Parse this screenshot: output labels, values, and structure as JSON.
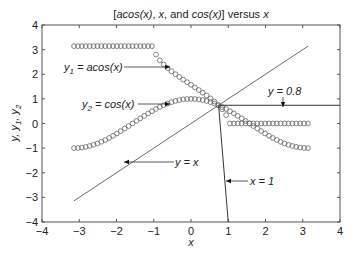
{
  "chart_data": {
    "type": "line",
    "title": "[acos(x), x, and cos(x)] versus x",
    "title_parts": [
      "[",
      "acos(x)",
      ", ",
      "x",
      ", and ",
      "cos(x)",
      "] versus ",
      "x"
    ],
    "xlabel": "x",
    "ylabel": "y, y1, y2",
    "xlim": [
      -4,
      4
    ],
    "ylim": [
      -4,
      4
    ],
    "xticks": [
      -4,
      -3,
      -2,
      -1,
      0,
      1,
      2,
      3,
      4
    ],
    "yticks": [
      -4,
      -3,
      -2,
      -1,
      0,
      1,
      2,
      3,
      4
    ],
    "grid": false,
    "series": [
      {
        "name": "y1 = acos(x)",
        "marker": "circle",
        "x_range": [
          -3.14,
          3.14
        ],
        "note": "real part of acos; flat at pi for x<-1, 0 for x>1"
      },
      {
        "name": "y2 = cos(x)",
        "marker": "circle",
        "x_range": [
          -3.14,
          3.14
        ]
      },
      {
        "name": "y = x",
        "marker": "none",
        "x_range": [
          -3.14,
          3.14
        ]
      },
      {
        "name": "y = 0.8",
        "marker": "none",
        "x_range": [
          0.74,
          4
        ]
      },
      {
        "name": "x = 1",
        "marker": "none",
        "points": [
          [
            0.74,
            0.74
          ],
          [
            1,
            -4
          ]
        ]
      }
    ],
    "annotations": [
      {
        "text": "y1 = acos(x)",
        "label_xy": [
          -1.6,
          2.2
        ],
        "arrow_to": [
          -0.7,
          2.2
        ]
      },
      {
        "text": "y2 = cos(x)",
        "label_xy": [
          -1.6,
          0.8
        ],
        "arrow_to": [
          -0.7,
          0.8
        ]
      },
      {
        "text": "y = 0.8",
        "label_xy": [
          2.5,
          1.1
        ],
        "arrow_to": [
          2.5,
          0.75
        ]
      },
      {
        "text": "y = x",
        "label_xy": [
          -0.4,
          -1.8
        ],
        "arrow_to": [
          -1.8,
          -1.8
        ]
      },
      {
        "text": "x = 1",
        "label_xy": [
          1.6,
          -2.5
        ],
        "arrow_to": [
          1.0,
          -2.5
        ]
      }
    ]
  }
}
